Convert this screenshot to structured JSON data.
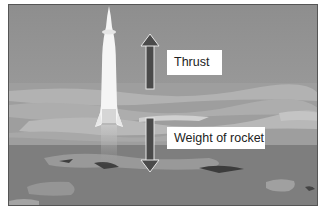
{
  "diagram": {
    "labels": {
      "thrust": "Thrust",
      "weight": "Weight of rocket"
    },
    "arrows": [
      {
        "name": "thrust-arrow",
        "direction": "up",
        "color": "#4a4a4a"
      },
      {
        "name": "weight-arrow",
        "direction": "down",
        "color": "#4a4a4a"
      }
    ],
    "colors": {
      "sky_top": "#8f8f8f",
      "sky_bottom": "#a0a0a0",
      "horizon": "#b4b4b4",
      "ground": "#7c7c7c",
      "rocket": "#f4f4f4",
      "label_bg": "#ffffff"
    }
  }
}
